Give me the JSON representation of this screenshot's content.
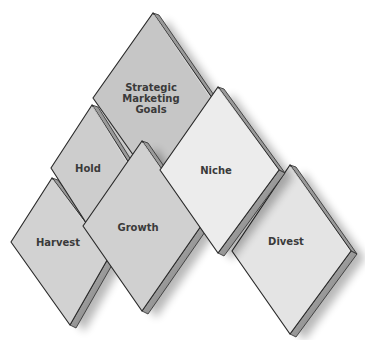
{
  "diagram": {
    "type": "diamond-cluster",
    "nodes": [
      {
        "id": "strategic",
        "label_lines": [
          "Strategic",
          "Marketing",
          "Goals"
        ],
        "top": [
          153,
          13
        ],
        "right": [
          212,
          98
        ],
        "bottom": [
          153,
          183
        ],
        "left": [
          93,
          98
        ],
        "face_color": "#c6c6c6",
        "text_pos": [
          151,
          98
        ]
      },
      {
        "id": "hold",
        "label_lines": [
          "Hold"
        ],
        "top": [
          92,
          105
        ],
        "right": [
          132,
          168
        ],
        "bottom": [
          92,
          232
        ],
        "left": [
          51,
          168
        ],
        "face_color": "#cdcdcd",
        "text_pos": [
          88,
          168
        ]
      },
      {
        "id": "harvest",
        "label_lines": [
          "Harvest"
        ],
        "top": [
          52,
          178
        ],
        "right": [
          110,
          255
        ],
        "bottom": [
          70,
          325
        ],
        "left": [
          11,
          242
        ],
        "face_color": "#d2d2d2",
        "text_pos": [
          58,
          242
        ]
      },
      {
        "id": "growth",
        "label_lines": [
          "Growth"
        ],
        "top": [
          142,
          141
        ],
        "right": [
          201,
          226
        ],
        "bottom": [
          142,
          311
        ],
        "left": [
          83,
          226
        ],
        "face_color": "#d0d0d0",
        "text_pos": [
          138,
          227
        ]
      },
      {
        "id": "niche",
        "label_lines": [
          "Niche"
        ],
        "top": [
          218,
          87
        ],
        "right": [
          279,
          170
        ],
        "bottom": [
          218,
          253
        ],
        "left": [
          160,
          170
        ],
        "face_color": "#ececec",
        "text_pos": [
          216,
          170
        ]
      },
      {
        "id": "divest",
        "label_lines": [
          "Divest"
        ],
        "top": [
          290,
          165
        ],
        "right": [
          351,
          251
        ],
        "bottom": [
          290,
          334
        ],
        "left": [
          232,
          251
        ],
        "face_color": "#e4e4e4",
        "text_pos": [
          286,
          241
        ]
      }
    ],
    "draw_order": [
      "harvest",
      "hold",
      "strategic",
      "growth",
      "divest",
      "niche"
    ],
    "extrusion": {
      "dx": 6,
      "dy": 3
    },
    "colors": {
      "outline": "#2a2a2a",
      "side_dark": "#6e6e6e",
      "side_light": "#b8b8b8",
      "shadow": "#000000",
      "text": "#3a3a3a"
    }
  }
}
